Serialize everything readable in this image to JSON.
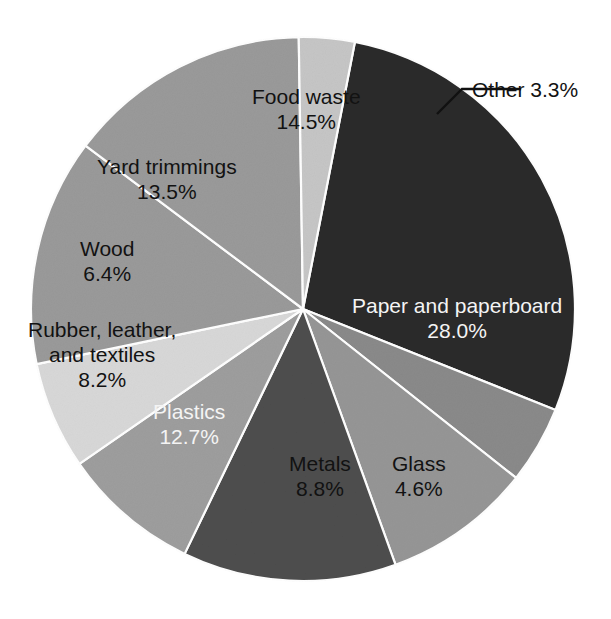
{
  "chart_data": {
    "type": "pie",
    "title": "",
    "subtitle": "",
    "xlabel": "",
    "ylabel": "",
    "legend_position": "none",
    "grid": false,
    "labels_inside": true,
    "units": "percent",
    "categories": [
      "Paper and paperboard",
      "Glass",
      "Metals",
      "Plastics",
      "Rubber, leather, and textiles",
      "Wood",
      "Yard trimmings",
      "Food waste",
      "Other"
    ],
    "values": [
      28.0,
      4.6,
      8.8,
      12.7,
      8.2,
      6.4,
      13.5,
      14.5,
      3.3
    ],
    "slices": [
      {
        "name": "paper",
        "label_line1": "Paper and paperboard",
        "label_line2": "28.0%",
        "value": 28.0,
        "color": "#2b2b2b",
        "text_color": "#f4f4f4",
        "start_angle": -79,
        "end_angle": 21.8
      },
      {
        "name": "glass",
        "label_line1": "Glass",
        "label_line2": "4.6%",
        "value": 4.6,
        "color": "#8a8a8a",
        "text_color": "#121212",
        "start_angle": 21.8,
        "end_angle": 38.4
      },
      {
        "name": "metals",
        "label_line1": "Metals",
        "label_line2": "8.8%",
        "value": 8.8,
        "color": "#969696",
        "text_color": "#121212",
        "start_angle": 38.4,
        "end_angle": 70.1
      },
      {
        "name": "plastics",
        "label_line1": "Plastics",
        "label_line2": "12.7%",
        "value": 12.7,
        "color": "#4e4e4e",
        "text_color": "#f4f4f4",
        "start_angle": 70.1,
        "end_angle": 115.8
      },
      {
        "name": "rubber-leather-textiles",
        "label_line1": "Rubber, leather,",
        "label_line1b": "and textiles",
        "label_line2": "8.2%",
        "value": 8.2,
        "color": "#9e9e9e",
        "text_color": "#121212",
        "start_angle": 115.8,
        "end_angle": 145.3
      },
      {
        "name": "wood",
        "label_line1": "Wood",
        "label_line2": "6.4%",
        "value": 6.4,
        "color": "#d8d8d8",
        "text_color": "#121212",
        "start_angle": 145.3,
        "end_angle": 168.3
      },
      {
        "name": "yard-trimmings",
        "label_line1": "Yard trimmings",
        "label_line2": "13.5%",
        "value": 13.5,
        "color": "#9a9a9a",
        "text_color": "#121212",
        "start_angle": 168.3,
        "end_angle": 216.9
      },
      {
        "name": "food-waste",
        "label_line1": "Food waste",
        "label_line2": "14.5%",
        "value": 14.5,
        "color": "#9a9a9a",
        "text_color": "#121212",
        "start_angle": 216.9,
        "end_angle": 269.1
      },
      {
        "name": "other",
        "label_line1": "Other 3.3%",
        "label_line2": "",
        "value": 3.3,
        "color": "#c6c6c6",
        "text_color": "#121212",
        "start_angle": 269.1,
        "end_angle": 281.0
      }
    ],
    "geometry": {
      "center_x": 303,
      "center_y": 309,
      "radius": 272
    },
    "callout": {
      "name": "other-callout",
      "text": "Other 3.3%",
      "leader_points": "437,114 462,89 521,89"
    }
  },
  "labels": {
    "paper": {
      "name": "Paper and paperboard",
      "pct": "28.0%"
    },
    "glass": {
      "name": "Glass",
      "pct": "4.6%"
    },
    "metals": {
      "name": "Metals",
      "pct": "8.8%"
    },
    "plastics": {
      "name": "Plastics",
      "pct": "12.7%"
    },
    "rubber": {
      "name1": "Rubber, leather,",
      "name2": "and textiles",
      "pct": "8.2%"
    },
    "wood": {
      "name": "Wood",
      "pct": "6.4%"
    },
    "yard": {
      "name": "Yard trimmings",
      "pct": "13.5%"
    },
    "food": {
      "name": "Food waste",
      "pct": "14.5%"
    },
    "other": {
      "name": "Other 3.3%"
    }
  },
  "colors": {
    "background": "#ffffff",
    "slice_border": "#ffffff",
    "dark_text": "#121212",
    "light_text": "#f4f4f4",
    "leader_line": "#111111"
  }
}
